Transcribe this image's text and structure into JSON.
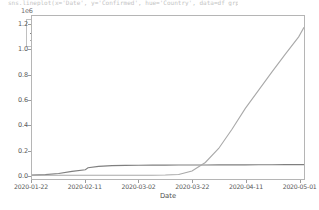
{
  "caption": {
    "text": "sns.lineplot(x='Date', y='Confirmed', hue='Country', data=df_grp)"
  },
  "colors": {
    "china_line": "#7f7f7f",
    "us_line": "#a9a9a9",
    "axis": "#b5b5b5",
    "tick_text": "#595959",
    "background": "#ffffff"
  },
  "legend": {
    "title": "Country",
    "entries": [
      {
        "label": "China",
        "color": "#7f7f7f"
      },
      {
        "label": "US",
        "color": "#a9a9a9"
      }
    ]
  },
  "chart_data": {
    "type": "line",
    "title": "",
    "subtitle": "",
    "xlabel": "Date",
    "ylabel": "",
    "y_exponent_label": "1e6",
    "grid": false,
    "legend_position": "upper left",
    "legend_title": "Country",
    "xtick_labels": [
      "2020-01-22",
      "2020-02-11",
      "2020-03-02",
      "2020-03-22",
      "2020-04-11",
      "2020-05-01"
    ],
    "ytick_labels": [
      "0.0",
      "0.2",
      "0.4",
      "0.6",
      "0.8",
      "1.0",
      "1.2"
    ],
    "ytick_values": [
      0,
      200000,
      400000,
      600000,
      800000,
      1000000,
      1200000
    ],
    "ylim": [
      -30000,
      1270000
    ],
    "xlim": [
      "2020-01-22",
      "2020-05-03"
    ],
    "x": [
      "2020-01-22",
      "2020-01-27",
      "2020-02-01",
      "2020-02-06",
      "2020-02-11",
      "2020-02-12",
      "2020-02-16",
      "2020-02-21",
      "2020-02-26",
      "2020-03-02",
      "2020-03-07",
      "2020-03-12",
      "2020-03-17",
      "2020-03-22",
      "2020-03-27",
      "2020-04-01",
      "2020-04-06",
      "2020-04-11",
      "2020-04-16",
      "2020-04-21",
      "2020-04-26",
      "2020-05-01",
      "2020-05-03"
    ],
    "series": [
      {
        "name": "China",
        "color": "#7f7f7f",
        "values": [
          548,
          4593,
          14380,
          31161,
          44386,
          59883,
          70513,
          76288,
          78630,
          80174,
          80859,
          81032,
          81116,
          81435,
          81897,
          82361,
          82665,
          82933,
          83356,
          83853,
          84341,
          84385,
          84400
        ]
      },
      {
        "name": "US",
        "color": "#a9a9a9",
        "values": [
          1,
          5,
          8,
          12,
          13,
          14,
          15,
          35,
          60,
          102,
          436,
          1663,
          6421,
          33276,
          101657,
          213372,
          366614,
          532879,
          678210,
          824229,
          965910,
          1103461,
          1180375
        ]
      }
    ]
  }
}
